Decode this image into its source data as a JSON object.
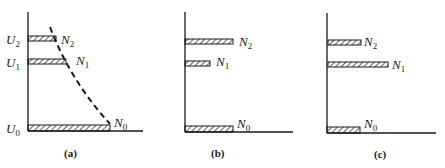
{
  "figure": {
    "panels": [
      {
        "id": "a",
        "caption": "(a)",
        "levels": [
          {
            "energy": "U",
            "energy_sub": "2",
            "pop": "N",
            "pop_sub": "2",
            "bar_len": 28
          },
          {
            "energy": "U",
            "energy_sub": "1",
            "pop": "N",
            "pop_sub": "1",
            "bar_len": 38
          },
          {
            "energy": "U",
            "energy_sub": "0",
            "pop": "N",
            "pop_sub": "0",
            "bar_len": 82
          }
        ],
        "dashed_curve": "Boltzmann distribution"
      },
      {
        "id": "b",
        "caption": "(b)",
        "levels": [
          {
            "pop": "N",
            "pop_sub": "2",
            "bar_len": 48
          },
          {
            "pop": "N",
            "pop_sub": "1",
            "bar_len": 25
          },
          {
            "pop": "N",
            "pop_sub": "0",
            "bar_len": 48
          }
        ]
      },
      {
        "id": "c",
        "caption": "(c)",
        "levels": [
          {
            "pop": "N",
            "pop_sub": "2",
            "bar_len": 33
          },
          {
            "pop": "N",
            "pop_sub": "1",
            "bar_len": 60
          },
          {
            "pop": "N",
            "pop_sub": "0",
            "bar_len": 33
          }
        ]
      }
    ],
    "colors": {
      "ink": "#1a1a1a",
      "background": "#ffffff"
    }
  }
}
